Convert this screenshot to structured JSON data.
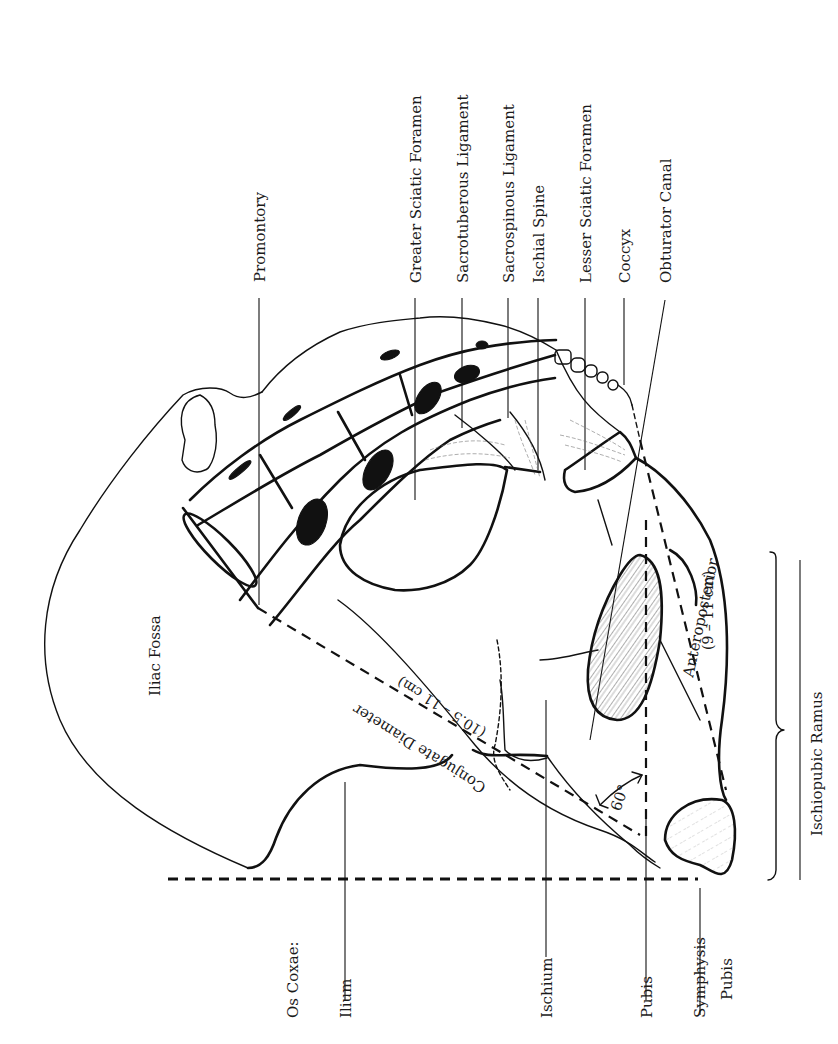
{
  "diagram": {
    "labels_top": [
      {
        "id": "promontory",
        "text": "Promontory",
        "x": 259
      },
      {
        "id": "greater-sciatic-foramen",
        "text": "Greater Sciatic Foramen",
        "x": 415
      },
      {
        "id": "sacrotuberous-ligament",
        "text": "Sacrotuberous Ligament",
        "x": 462
      },
      {
        "id": "sacrospinous-ligament",
        "text": "Sacrospinous Ligament",
        "x": 508
      },
      {
        "id": "ischial-spine",
        "text": "Ischial Spine",
        "x": 538
      },
      {
        "id": "lesser-sciatic-foramen",
        "text": "Lesser Sciatic Foramen",
        "x": 585
      },
      {
        "id": "coccyx",
        "text": "Coccyx",
        "x": 624
      },
      {
        "id": "obturator-canal",
        "text": "Obturator Canal",
        "x": 665
      }
    ],
    "labels_bottom": [
      {
        "id": "os-coxae",
        "text": "Os Coxae:",
        "x": 298
      },
      {
        "id": "ilium",
        "text": "Ilium",
        "x": 345
      },
      {
        "id": "ischium",
        "text": "Ischium",
        "x": 546
      },
      {
        "id": "pubis",
        "text": "Pubis",
        "x": 646
      },
      {
        "id": "symphysis-pubis-1",
        "text": "Symphysis",
        "x": 700
      },
      {
        "id": "symphysis-pubis-2",
        "text": "Pubis",
        "x": 727
      }
    ],
    "labels_inner": {
      "iliac_fossa": "Iliac Fossa",
      "ischiopubic_ramus": "Ischiopubic Ramus",
      "conjugate_diameter": "Conjugate Diameter",
      "conjugate_measure": "(10.5 – 11 cm)",
      "anteroposterior": "Anteroposterior",
      "anteroposterior_measure": "(9 – 11 cm)",
      "angle": "60°"
    },
    "colors": {
      "ink": "#111111",
      "background": "#ffffff"
    }
  }
}
